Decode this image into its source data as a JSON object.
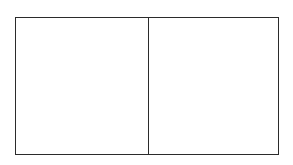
{
  "diagram": {
    "type": "partitioned-rectangle",
    "cells": [
      {
        "id": "left",
        "label": ""
      },
      {
        "id": "right",
        "label": ""
      }
    ],
    "colors": {
      "stroke": "#2b2b2b",
      "fill": "#ffffff",
      "background": "#ffffff"
    }
  }
}
